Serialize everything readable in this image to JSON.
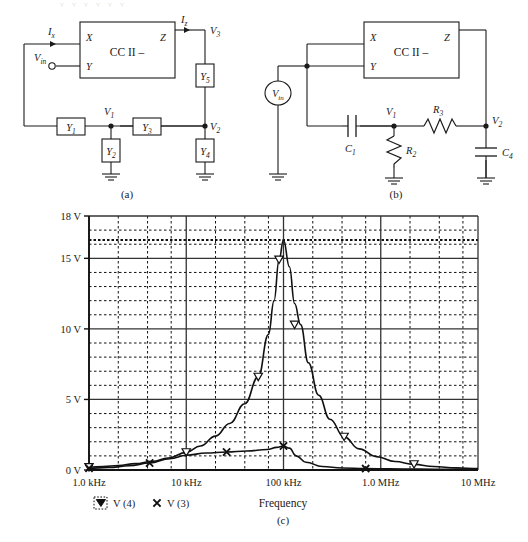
{
  "page": {
    "clipped_header": "v  v   v  v    v  v",
    "caption_a": "(a)",
    "caption_b": "(b)",
    "caption_c": "(c)"
  },
  "circuit_a": {
    "block_label": "CC II –",
    "ports": {
      "x": "X",
      "y": "Y",
      "z": "Z"
    },
    "currents": {
      "ix": "I",
      "ix_sub": "x",
      "iz": "I",
      "iz_sub": "z"
    },
    "source": {
      "label": "V",
      "sub": "in"
    },
    "nodes": [
      {
        "label": "V",
        "sub": "3"
      },
      {
        "label": "V",
        "sub": "1"
      },
      {
        "label": "V",
        "sub": "2"
      }
    ],
    "admittances": [
      {
        "label": "Y",
        "sub": "1"
      },
      {
        "label": "Y",
        "sub": "2"
      },
      {
        "label": "Y",
        "sub": "3"
      },
      {
        "label": "Y",
        "sub": "4"
      },
      {
        "label": "Y",
        "sub": "5"
      }
    ]
  },
  "circuit_b": {
    "block_label": "CC II –",
    "ports": {
      "x": "X",
      "y": "Y",
      "z": "Z"
    },
    "source": {
      "label": "V",
      "sub": "in"
    },
    "nodes": [
      {
        "label": "V",
        "sub": "1"
      },
      {
        "label": "V",
        "sub": "2"
      }
    ],
    "components": [
      {
        "label": "C",
        "sub": "1",
        "type": "capacitor"
      },
      {
        "label": "R",
        "sub": "2",
        "type": "resistor"
      },
      {
        "label": "R",
        "sub": "3",
        "type": "resistor"
      },
      {
        "label": "C",
        "sub": "4",
        "type": "capacitor"
      }
    ]
  },
  "chart_data": {
    "type": "line",
    "title": "",
    "xlabel": "Frequency",
    "ylabel": "",
    "x_scale": "log",
    "xlim": [
      1000,
      10000000
    ],
    "ylim": [
      0,
      18
    ],
    "grid": true,
    "legend_position": "below-left",
    "x_tick_labels": [
      "1.0 kHz",
      "10 kHz",
      "100 kHz",
      "1.0 MHz",
      "10 MHz"
    ],
    "x_tick_values": [
      1000,
      10000,
      100000,
      1000000,
      10000000
    ],
    "y_tick_labels": [
      "0 V",
      "5 V",
      "10 V",
      "15 V",
      "18 V"
    ],
    "y_tick_values": [
      0,
      5,
      10,
      15,
      18
    ],
    "y_minor_step": 1,
    "peak_marker_line": 16.3,
    "series": [
      {
        "name": "V (4)",
        "marker": "triangle-down",
        "x": [
          1000,
          1400,
          2000,
          3000,
          4500,
          6500,
          10000,
          14000,
          20000,
          28000,
          40000,
          55000,
          70000,
          80000,
          90000,
          100000,
          115000,
          130000,
          150000,
          180000,
          230000,
          300000,
          420000,
          600000,
          900000,
          1400000,
          2200000,
          3500000,
          6000000,
          10000000
        ],
        "y": [
          0.2,
          0.25,
          0.32,
          0.45,
          0.62,
          0.85,
          1.25,
          1.7,
          2.4,
          3.3,
          4.7,
          6.6,
          9.6,
          12.0,
          14.9,
          16.3,
          14.4,
          11.8,
          10.3,
          7.6,
          5.3,
          3.6,
          2.35,
          1.5,
          0.95,
          0.6,
          0.4,
          0.25,
          0.15,
          0.1
        ],
        "marker_x": [
          1000,
          10000,
          55000,
          90000,
          130000,
          420000,
          2200000
        ],
        "marker_y": [
          0.2,
          1.25,
          6.6,
          14.9,
          10.3,
          2.35,
          0.4
        ]
      },
      {
        "name": "V (3)",
        "marker": "cross",
        "x": [
          1000,
          1600,
          2600,
          4200,
          6800,
          10000,
          16000,
          26000,
          42000,
          68000,
          85000,
          100000,
          115000,
          135000,
          170000,
          250000,
          400000,
          700000,
          1200000,
          2500000,
          5000000,
          10000000
        ],
        "y": [
          0.12,
          0.18,
          0.3,
          0.5,
          0.8,
          1.05,
          1.2,
          1.28,
          1.35,
          1.45,
          1.6,
          1.7,
          1.55,
          1.0,
          0.55,
          0.25,
          0.14,
          0.1,
          0.08,
          0.06,
          0.05,
          0.05
        ],
        "marker_x": [
          1000,
          4200,
          26000,
          100000,
          700000
        ],
        "marker_y": [
          0.12,
          0.5,
          1.28,
          1.7,
          0.1
        ]
      }
    ]
  }
}
